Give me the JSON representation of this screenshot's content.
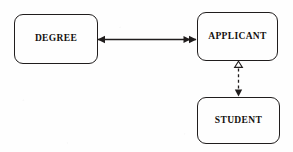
{
  "diagram": {
    "type": "entity-relationship",
    "background_color": "#fefefe",
    "stroke_color": "#201d1d",
    "nodes": [
      {
        "id": "degree",
        "label": "DEGREE",
        "shape": "rounded-rectangle",
        "x": 14,
        "y": 14,
        "width": 84,
        "height": 50
      },
      {
        "id": "applicant",
        "label": "APPLICANT",
        "shape": "rounded-rectangle",
        "x": 197,
        "y": 12,
        "width": 81,
        "height": 49
      },
      {
        "id": "student",
        "label": "STUDENT",
        "shape": "rounded-rectangle",
        "x": 197,
        "y": 97,
        "width": 83,
        "height": 47
      }
    ],
    "edges": [
      {
        "id": "degree-applicant",
        "from": "degree",
        "to": "applicant",
        "orientation": "horizontal",
        "line_style": "solid",
        "source_marker": "single-arrowhead",
        "target_marker": "double-arrowhead"
      },
      {
        "id": "applicant-student",
        "from": "student",
        "to": "applicant",
        "orientation": "vertical",
        "line_style": "dashed",
        "source_marker": "hollow-triangle",
        "target_marker": "solid-arrowhead"
      }
    ]
  }
}
